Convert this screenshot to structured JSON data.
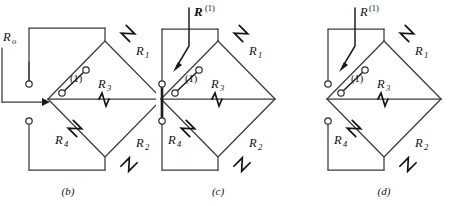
{
  "figure": {
    "background_color": "#ffffff",
    "line_color": "#3b3b3b",
    "label_color": "#111111"
  },
  "panels": [
    {
      "id": "b",
      "caption": "(b)",
      "source_label": {
        "base": "R",
        "subscript": "o",
        "superscript": ""
      },
      "node_label": "(1)",
      "resistors": [
        {
          "name": "R1",
          "base": "R",
          "subscript": "1",
          "position": "upper-right"
        },
        {
          "name": "R2",
          "base": "R",
          "subscript": "2",
          "position": "lower-right"
        },
        {
          "name": "R3",
          "base": "R",
          "subscript": "3",
          "position": "center-horizontal"
        },
        {
          "name": "R4",
          "base": "R",
          "subscript": "4",
          "position": "lower-left"
        }
      ],
      "left_terminals": 2,
      "has_shorting_bar": false,
      "has_injection_arrow": true,
      "has_pointer_arrow": false
    },
    {
      "id": "c",
      "caption": "(c)",
      "source_label": {
        "base": "R",
        "subscript": "",
        "superscript": "(1)"
      },
      "node_label": "(1)",
      "resistors": [
        {
          "name": "R1",
          "base": "R",
          "subscript": "1",
          "position": "upper-right"
        },
        {
          "name": "R2",
          "base": "R",
          "subscript": "2",
          "position": "lower-right"
        },
        {
          "name": "R3",
          "base": "R",
          "subscript": "3",
          "position": "center-horizontal"
        },
        {
          "name": "R4",
          "base": "R",
          "subscript": "4",
          "position": "lower-left"
        }
      ],
      "left_terminals": 2,
      "has_shorting_bar": true,
      "has_injection_arrow": false,
      "has_pointer_arrow": true
    },
    {
      "id": "d",
      "caption": "(d)",
      "source_label": {
        "base": "R",
        "subscript": "",
        "superscript": "(1)"
      },
      "node_label": "(1)",
      "resistors": [
        {
          "name": "R1",
          "base": "R",
          "subscript": "1",
          "position": "upper-right"
        },
        {
          "name": "R2",
          "base": "R",
          "subscript": "2",
          "position": "lower-right"
        },
        {
          "name": "R3",
          "base": "R",
          "subscript": "3",
          "position": "center-horizontal"
        },
        {
          "name": "R4",
          "base": "R",
          "subscript": "4",
          "position": "lower-left"
        }
      ],
      "left_terminals": 2,
      "has_shorting_bar": false,
      "has_injection_arrow": false,
      "has_pointer_arrow": true
    }
  ]
}
